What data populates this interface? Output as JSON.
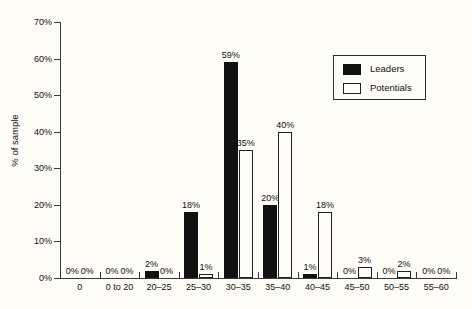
{
  "chart_data": {
    "type": "bar",
    "title": "",
    "xlabel": "",
    "ylabel": "% of sample",
    "ylim": [
      0,
      70
    ],
    "ytick_labels": [
      "0%",
      "10%",
      "20%",
      "30%",
      "40%",
      "50%",
      "60%",
      "70%"
    ],
    "ytick_values": [
      0,
      10,
      20,
      30,
      40,
      50,
      60,
      70
    ],
    "grid": false,
    "legend_position": "top-right",
    "categories": [
      "0",
      "0 to 20",
      "20–25",
      "25–30",
      "30–35",
      "35–40",
      "40–45",
      "45–50",
      "50–55",
      "55–60"
    ],
    "series": [
      {
        "name": "Leaders",
        "color": "#111111",
        "values": [
          0,
          0,
          2,
          18,
          59,
          20,
          1,
          0,
          0,
          0
        ],
        "labels": [
          "0%",
          "0%",
          "2%",
          "18%",
          "59%",
          "20%",
          "1%",
          "0%",
          "0%",
          "0%"
        ]
      },
      {
        "name": "Potentials",
        "color": "#ffffff",
        "values": [
          0,
          0,
          0,
          1,
          35,
          40,
          18,
          3,
          2,
          0
        ],
        "labels": [
          "0%",
          "0%",
          "0%",
          "1%",
          "35%",
          "40%",
          "18%",
          "3%",
          "2%",
          "0%"
        ]
      }
    ]
  },
  "legend": {
    "items": [
      {
        "label": "Leaders"
      },
      {
        "label": "Potentials"
      }
    ]
  }
}
